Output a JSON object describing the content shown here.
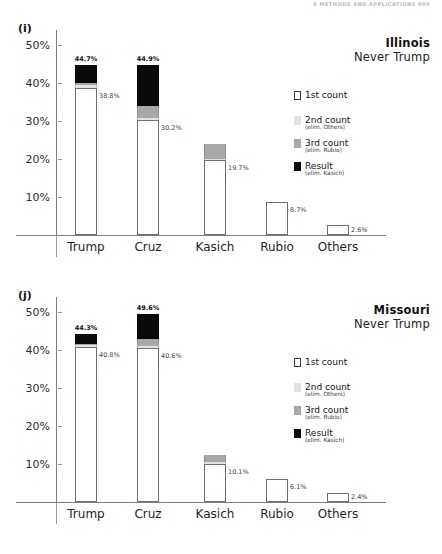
{
  "page_header": "6  METHODS AND APPLICATIONS     000",
  "legend": {
    "items": [
      {
        "swatch": "first",
        "label": "1st count",
        "sub": ""
      },
      {
        "swatch": "second",
        "label": "2nd count",
        "sub": "(elim. Others)"
      },
      {
        "swatch": "third",
        "label": "3rd count",
        "sub": "(elim. Rubio)"
      },
      {
        "swatch": "result",
        "label": "Result",
        "sub": "(elim. Kasich)"
      }
    ]
  },
  "colors": {
    "first_count": "#ffffff",
    "second_count": "#e2e2e2",
    "third_count": "#a8a8a8",
    "result": "#090909",
    "axis": "#7d7d7d",
    "text": "#1a1a1a"
  },
  "chart_data": [
    {
      "type": "bar",
      "panel": "(i)",
      "title": "Illinois",
      "subtitle": "Never Trump",
      "xlabel": "",
      "ylabel": "",
      "ylim": [
        0,
        54
      ],
      "yticks": [
        10,
        20,
        30,
        40,
        50
      ],
      "ytick_labels": [
        "10%",
        "20%",
        "30%",
        "40%",
        "50%"
      ],
      "grid": false,
      "legend_position": "right",
      "categories": [
        "Trump",
        "Cruz",
        "Kasich",
        "Rubio",
        "Others"
      ],
      "series": [
        {
          "name": "1st count",
          "values": [
            38.8,
            30.2,
            19.7,
            8.7,
            2.6
          ]
        },
        {
          "name": "2nd count",
          "values": [
            39.4,
            30.7,
            20.1,
            8.7,
            2.6
          ]
        },
        {
          "name": "3rd count",
          "values": [
            40.0,
            34.0,
            24.0,
            8.7,
            2.6
          ]
        },
        {
          "name": "Result",
          "values": [
            44.7,
            44.9,
            24.0,
            8.7,
            2.6
          ]
        }
      ],
      "total_labels": [
        "44.7%",
        "44.9%",
        "",
        "",
        ""
      ],
      "first_count_labels": [
        "38.8%",
        "30.2%",
        "19.7%",
        "8.7%",
        "2.6%"
      ]
    },
    {
      "type": "bar",
      "panel": "(j)",
      "title": "Missouri",
      "subtitle": "Never Trump",
      "xlabel": "",
      "ylabel": "",
      "ylim": [
        0,
        54
      ],
      "yticks": [
        10,
        20,
        30,
        40,
        50
      ],
      "ytick_labels": [
        "10%",
        "20%",
        "30%",
        "40%",
        "50%"
      ],
      "grid": false,
      "legend_position": "right",
      "categories": [
        "Trump",
        "Cruz",
        "Kasich",
        "Rubio",
        "Others"
      ],
      "series": [
        {
          "name": "1st count",
          "values": [
            40.8,
            40.6,
            10.1,
            6.1,
            2.4
          ]
        },
        {
          "name": "2nd count",
          "values": [
            41.3,
            41.2,
            10.5,
            6.1,
            2.4
          ]
        },
        {
          "name": "3rd count",
          "values": [
            41.7,
            43.0,
            12.5,
            6.1,
            2.4
          ]
        },
        {
          "name": "Result",
          "values": [
            44.3,
            49.6,
            12.5,
            6.1,
            2.4
          ]
        }
      ],
      "total_labels": [
        "44.3%",
        "49.6%",
        "",
        "",
        ""
      ],
      "first_count_labels": [
        "40.8%",
        "40.6%",
        "10.1%",
        "6.1%",
        "2.4%"
      ]
    }
  ]
}
